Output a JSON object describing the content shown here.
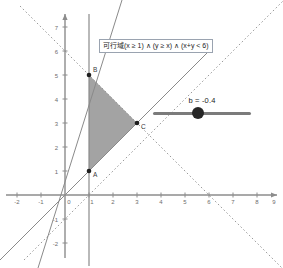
{
  "figure": {
    "type": "linear-programming-feasible-region",
    "condition_label": "可行域(x ≥ 1) ∧ (y ≥ x) ∧ (x+y < 6)"
  },
  "axes": {
    "x_ticks": [
      "-2",
      "-1",
      "0",
      "1",
      "2",
      "3",
      "4",
      "5",
      "6",
      "7",
      "8",
      "9"
    ],
    "y_ticks": [
      "-2",
      "-1",
      "1",
      "2",
      "3",
      "4",
      "5",
      "6",
      "7"
    ],
    "x_range": [
      -2.6,
      9.4
    ],
    "y_range": [
      -2.6,
      7.6
    ],
    "origin_label": "0",
    "axis_color": "#8c8c8c"
  },
  "region": {
    "label": "feasible-region",
    "fill": "#9b9b9b",
    "vertices": [
      {
        "label": "A",
        "x": 1,
        "y": 1
      },
      {
        "label": "B",
        "x": 1,
        "y": 5
      },
      {
        "label": "C",
        "x": 3,
        "y": 3
      }
    ]
  },
  "lines": [
    {
      "name": "x-equals-1",
      "style": "solid",
      "color": "#8a8a8a"
    },
    {
      "name": "y-equals-x",
      "style": "solid",
      "color": "#8a8a8a"
    },
    {
      "name": "objective-line",
      "style": "solid",
      "color": "#8a8a8a"
    },
    {
      "name": "x-plus-y-equals-6",
      "style": "dashed",
      "color": "#9a9a9a"
    }
  ],
  "slider": {
    "name": "b",
    "value_label": "b = -0.4",
    "value": -0.4,
    "min": -5,
    "max": 5,
    "knob_color": "#262626",
    "track_color": "#7b7b7b"
  }
}
